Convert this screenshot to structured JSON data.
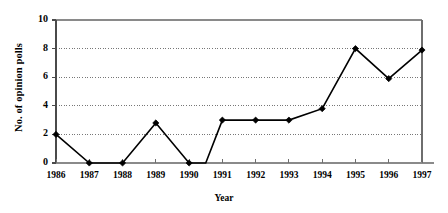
{
  "chart_data": {
    "type": "line",
    "title": "",
    "xlabel": "Year",
    "ylabel": "No. of opinion polls",
    "xlim": [
      1986,
      1997
    ],
    "ylim": [
      0,
      10
    ],
    "grid": true,
    "grid_axis": "y",
    "legend": false,
    "marker": "filled-diamond",
    "line_color": "#000000",
    "marker_color": "#000000",
    "grid_color": "#555555",
    "axis_color": "#808080",
    "categories": [
      1986,
      1987,
      1988,
      1989,
      1990,
      1991,
      1992,
      1993,
      1994,
      1995,
      1996,
      1997
    ],
    "values": [
      2,
      0,
      0,
      2.8,
      0,
      3,
      3,
      3,
      3.8,
      8,
      5.9,
      7.9
    ],
    "extra_vertices": [
      {
        "x": 1990.5,
        "y": 0,
        "marker": false
      }
    ],
    "xticks": [
      1986,
      1987,
      1988,
      1989,
      1990,
      1991,
      1992,
      1993,
      1994,
      1995,
      1996,
      1997
    ],
    "xtick_labels": [
      "1986",
      "1987",
      "1988",
      "1989",
      "1990",
      "1991",
      "1992",
      "1993",
      "1994",
      "1995",
      "1996",
      "1997"
    ],
    "yticks": [
      0,
      2,
      4,
      6,
      8,
      10
    ],
    "ytick_labels": [
      "0",
      "2",
      "4",
      "6",
      "8",
      "10"
    ]
  }
}
